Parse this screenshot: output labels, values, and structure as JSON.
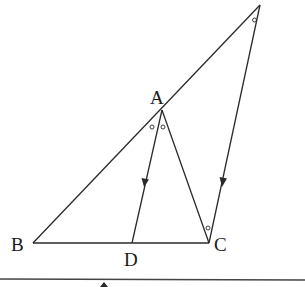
{
  "diagram": {
    "type": "geometry-triangle",
    "labels": {
      "A": "A",
      "B": "B",
      "C": "C",
      "D": "D",
      "E": "E"
    },
    "points": {
      "E": [
        260,
        5
      ],
      "A": [
        162,
        110
      ],
      "B": [
        33,
        243
      ],
      "D": [
        132,
        243
      ],
      "C": [
        209,
        243
      ]
    },
    "segments": [
      {
        "from": "B",
        "to": "E"
      },
      {
        "from": "B",
        "to": "C"
      },
      {
        "from": "A",
        "to": "C"
      },
      {
        "from": "A",
        "to": "D"
      },
      {
        "from": "E",
        "to": "C"
      }
    ],
    "parallel_marks": [
      {
        "segment": "AD",
        "direction": "down"
      },
      {
        "segment": "EC",
        "direction": "down"
      }
    ],
    "equal_angle_marks": [
      "E",
      "BAD",
      "DAC",
      "ACE"
    ],
    "colors": {
      "line": "#2a2a2a",
      "background": "#ffffff"
    }
  }
}
